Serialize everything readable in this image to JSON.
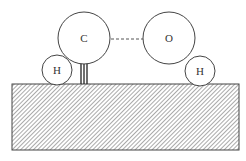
{
  "diagram": {
    "atoms": [
      {
        "id": "carbon",
        "label": "C",
        "cx": 84,
        "cy": 38,
        "r": 26
      },
      {
        "id": "oxygen",
        "label": "O",
        "cx": 169,
        "cy": 38,
        "r": 26
      },
      {
        "id": "hydrogen-left",
        "label": "H",
        "cx": 57,
        "cy": 70,
        "r": 15
      },
      {
        "id": "hydrogen-right",
        "label": "H",
        "cx": 200,
        "cy": 71,
        "r": 15
      }
    ],
    "bonds": [
      {
        "type": "surface-double-bond",
        "from": "carbon",
        "to": "surface"
      },
      {
        "type": "dashed",
        "from": "carbon",
        "to": "oxygen"
      }
    ],
    "surface": {
      "x": 12,
      "y": 84,
      "width": 227,
      "height": 66,
      "pattern": "diagonal-hatch"
    },
    "colors": {
      "stroke": "#444444",
      "background": "#ffffff"
    }
  }
}
